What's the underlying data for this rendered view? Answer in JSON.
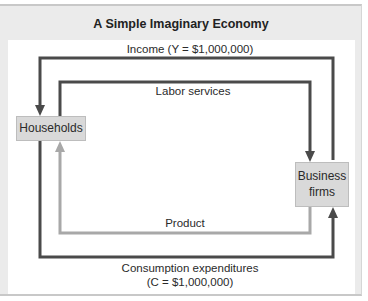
{
  "diagram": {
    "title": "A Simple Imaginary Economy",
    "nodes": {
      "households": "Households",
      "business_line1": "Business",
      "business_line2": "firms"
    },
    "flows": {
      "income": "Income (Y = $1,000,000)",
      "labor": "Labor services",
      "product": "Product",
      "consumption_line1": "Consumption expenditures",
      "consumption_line2": "(C = $1,000,000)"
    },
    "colors": {
      "panel_bg": "#ebebeb",
      "money_flow": "#4a4a4a",
      "product_flow": "#a8a8a8",
      "node_fill": "#d9d9d9"
    }
  }
}
